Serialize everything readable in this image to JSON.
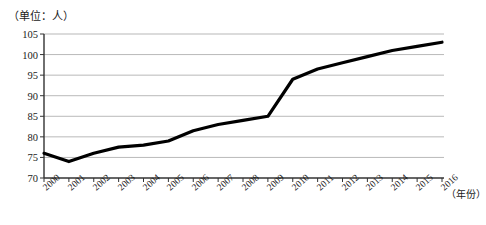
{
  "chart_data": {
    "type": "line",
    "title": "",
    "unit_label": "（单位：人）",
    "xlabel": "（年份）",
    "ylabel": "",
    "categories": [
      "2000",
      "2001",
      "2002",
      "2003",
      "2004",
      "2005",
      "2006",
      "2007",
      "2008",
      "2009",
      "2010",
      "2011",
      "2012",
      "2013",
      "2014",
      "2015",
      "2016"
    ],
    "x": [
      2000,
      2001,
      2002,
      2003,
      2004,
      2005,
      2006,
      2007,
      2008,
      2009,
      2010,
      2011,
      2012,
      2013,
      2014,
      2015,
      2016
    ],
    "values": [
      76,
      74,
      76,
      77.5,
      78,
      79,
      81.5,
      83,
      84,
      85,
      94,
      96.5,
      98,
      99.5,
      101,
      102,
      103
    ],
    "ylim": [
      70,
      105
    ],
    "yticks": [
      70,
      75,
      80,
      85,
      90,
      95,
      100,
      105
    ],
    "ytick_labels": [
      "70",
      "75",
      "80",
      "85",
      "90",
      "95",
      "100",
      "105"
    ],
    "xlim": [
      2000,
      2016
    ],
    "grid": true,
    "legend": false,
    "series": [
      {
        "name": "人数",
        "values": [
          76,
          74,
          76,
          77.5,
          78,
          79,
          81.5,
          83,
          84,
          85,
          94,
          96.5,
          98,
          99.5,
          101,
          102,
          103
        ],
        "color": "#000000"
      }
    ],
    "colors": {
      "line": "#000000",
      "axis": "#333333",
      "grid": "#999999",
      "background": "#ffffff",
      "text": "#1a1a1a"
    }
  }
}
